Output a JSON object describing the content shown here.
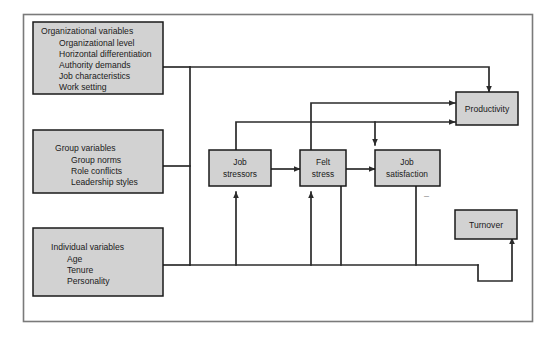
{
  "figure": {
    "type": "flow-diagram",
    "frame_color": "#6b6b6b",
    "box_fill": "#d2d2d2",
    "box_border": "#1a1a1a",
    "connector_color": "#2b2b2b",
    "canvas": {
      "width": 553,
      "height": 340
    }
  },
  "source_boxes": [
    {
      "id": "organizational",
      "title": "Organizational variables",
      "items": [
        "Organizational level",
        "Horizontal differentiation",
        "Authority demands",
        "Job characteristics",
        "Work setting"
      ]
    },
    {
      "id": "group",
      "title": "Group variables",
      "items": [
        "Group norms",
        "Role conflicts",
        "Leadership styles"
      ]
    },
    {
      "id": "individual",
      "title": "Individual variables",
      "items": [
        "Age",
        "Tenure",
        "Personality"
      ]
    }
  ],
  "process_boxes": [
    {
      "id": "job-stressors",
      "line1": "Job",
      "line2": "stressors"
    },
    {
      "id": "felt-stress",
      "line1": "Felt",
      "line2": "stress"
    },
    {
      "id": "job-satisfaction",
      "line1": "Job",
      "line2": "satisfaction"
    }
  ],
  "outcome_boxes": [
    {
      "id": "productivity",
      "label": "Productivity"
    },
    {
      "id": "turnover",
      "label": "Turnover"
    }
  ],
  "annotations": [
    {
      "id": "negative-sign",
      "symbol": "–",
      "near": "job-satisfaction"
    }
  ],
  "bullet": "•"
}
